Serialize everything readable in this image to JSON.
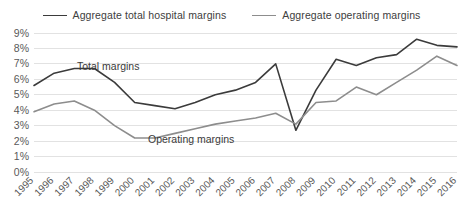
{
  "chart_data": {
    "type": "line",
    "title": "",
    "xlabel": "",
    "ylabel": "",
    "grid": true,
    "legend_position": "top-center",
    "ylim": [
      0,
      9
    ],
    "ytick_labels": [
      "0%",
      "1%",
      "2%",
      "3%",
      "4%",
      "5%",
      "6%",
      "7%",
      "8%",
      "9%"
    ],
    "ytick_values": [
      0,
      1,
      2,
      3,
      4,
      5,
      6,
      7,
      8,
      9
    ],
    "categories": [
      "1995",
      "1996",
      "1997",
      "1998",
      "1999",
      "2000",
      "2001",
      "2002",
      "2003",
      "2004",
      "2005",
      "2006",
      "2007",
      "2008",
      "2009",
      "2010",
      "2011",
      "2012",
      "2013",
      "2014",
      "2015",
      "2016"
    ],
    "series": [
      {
        "name": "Aggregate total hospital margins",
        "color": "#3b3b3b",
        "values": [
          5.6,
          6.4,
          6.7,
          6.7,
          5.8,
          4.5,
          4.3,
          4.1,
          4.5,
          5.0,
          5.3,
          5.8,
          7.0,
          2.7,
          5.3,
          7.3,
          6.9,
          7.4,
          7.6,
          8.6,
          8.2,
          8.1
        ]
      },
      {
        "name": "Aggregate operating margins",
        "color": "#8d8d8d",
        "values": [
          3.9,
          4.4,
          4.6,
          4.0,
          3.0,
          2.2,
          2.2,
          2.5,
          2.8,
          3.1,
          3.3,
          3.5,
          3.8,
          3.1,
          4.5,
          4.6,
          5.5,
          5.0,
          5.8,
          6.6,
          7.5,
          6.9
        ]
      }
    ],
    "annotations": [
      {
        "text": "Total margins",
        "series": "Aggregate total hospital margins"
      },
      {
        "text": "Operating margins",
        "series": "Aggregate operating margins"
      }
    ]
  },
  "legend": {
    "items": [
      {
        "label": "Aggregate total hospital margins"
      },
      {
        "label": "Aggregate operating margins"
      }
    ]
  }
}
